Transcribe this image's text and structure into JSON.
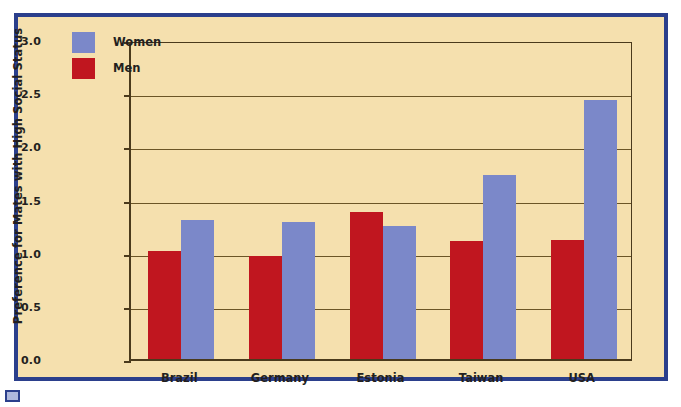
{
  "chart_data": {
    "type": "bar",
    "title": "",
    "subtitle": "",
    "xlabel": "",
    "ylabel": "Preference for Mates with High Social Status",
    "categories": [
      "Brazil",
      "Germany",
      "Estonia",
      "Taiwan",
      "USA"
    ],
    "series": [
      {
        "name": "Men",
        "color": "#c0161f",
        "values": [
          1.02,
          0.97,
          1.38,
          1.11,
          1.12
        ]
      },
      {
        "name": "Women",
        "color": "#7b88c9",
        "values": [
          1.31,
          1.29,
          1.25,
          1.73,
          2.44
        ]
      }
    ],
    "series_order_in_group": [
      "Men",
      "Women"
    ],
    "ylim": [
      0.0,
      3.0
    ],
    "ytick_labels": [
      "0.0",
      "0.5",
      "1.0",
      "1.5",
      "2.0",
      "2.5",
      "3.0"
    ],
    "ytick_values": [
      0.0,
      0.5,
      1.0,
      1.5,
      2.0,
      2.5,
      3.0
    ],
    "grid": true,
    "grid_axis": "y",
    "legend": {
      "position": "top-left-inside",
      "entries": [
        {
          "label": "Women",
          "color": "#7b88c9"
        },
        {
          "label": "Men",
          "color": "#c0161f"
        }
      ]
    }
  },
  "figure": {
    "background_color": "#f5e0ae",
    "frame_color": "#2b3f8c",
    "axis_color": "#4a3a1c",
    "grid_color": "#6b5526",
    "caption_marker": "blue-square-marker"
  }
}
